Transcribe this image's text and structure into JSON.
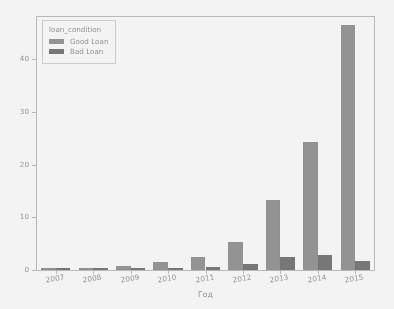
{
  "chart_data": {
    "type": "bar",
    "title": "",
    "xlabel": "Год",
    "ylabel": "",
    "categories": [
      "2007",
      "2008",
      "2009",
      "2010",
      "2011",
      "2012",
      "2013",
      "2014",
      "2015"
    ],
    "series": [
      {
        "name": "Good Loan",
        "color": "#8d8d8d",
        "values": [
          0.1,
          0.25,
          0.7,
          1.5,
          2.4,
          5.4,
          13.3,
          24.3,
          46.4
        ]
      },
      {
        "name": "Bad Loan",
        "color": "#6d6d6d",
        "values": [
          0.02,
          0.05,
          0.12,
          0.3,
          0.6,
          1.2,
          2.4,
          2.9,
          1.8
        ]
      }
    ],
    "ylim": [
      0,
      48
    ],
    "yticks": [
      0,
      10,
      20,
      30,
      40
    ],
    "ytick_labels": [
      "0",
      "10",
      "20",
      "30",
      "40"
    ],
    "grid": false,
    "legend_position": "upper left",
    "legend_title": "loan_condition"
  },
  "legend": {
    "title": "loan_condition",
    "entries": [
      {
        "label": "Good Loan",
        "color": "#8d8d8d"
      },
      {
        "label": "Bad Loan",
        "color": "#6d6d6d"
      }
    ]
  },
  "axes": {
    "xlabel": "Год",
    "ylabel": ""
  }
}
